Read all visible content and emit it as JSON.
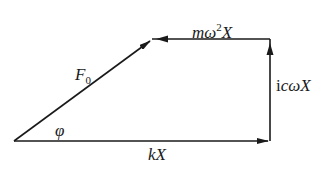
{
  "diagram": {
    "type": "vector-force-polygon",
    "stroke_color": "#1a1a1a",
    "background": "#ffffff",
    "vectors": [
      {
        "id": "kX",
        "label": "kX",
        "from": [
          14,
          141
        ],
        "to": [
          270,
          141
        ],
        "direction": "right"
      },
      {
        "id": "icwX",
        "label": "icωX",
        "from": [
          270,
          141
        ],
        "to": [
          270,
          39
        ],
        "direction": "up"
      },
      {
        "id": "mw2X",
        "label": "mω²X",
        "from": [
          270,
          39
        ],
        "to": [
          152,
          39
        ],
        "direction": "left"
      },
      {
        "id": "F0",
        "label": "F0",
        "from": [
          14,
          141
        ],
        "to": [
          152,
          39
        ],
        "direction": "up-right"
      }
    ],
    "angle": {
      "symbol": "φ",
      "between": [
        "F0",
        "kX"
      ]
    }
  },
  "labels": {
    "kX": {
      "main": "kX"
    },
    "icwX": {
      "prefix": "i",
      "main": "cωX"
    },
    "mw2X": {
      "main": "mω",
      "sup": "2",
      "tail": "X"
    },
    "F0": {
      "main": "F",
      "sub": "0"
    },
    "phi": {
      "main": "φ"
    }
  }
}
